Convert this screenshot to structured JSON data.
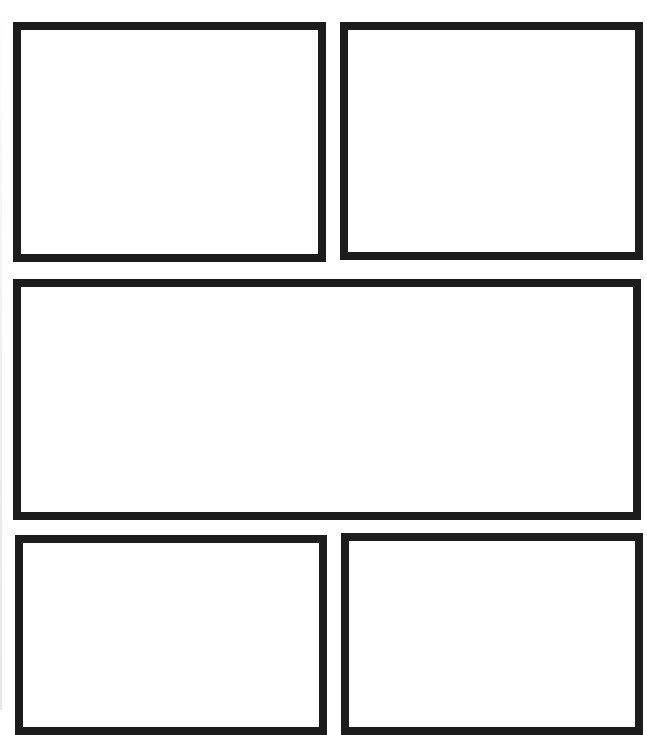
{
  "page": {
    "type": "comic-panel-layout-template",
    "background": "#ffffff",
    "border_color": "#1c1c1c",
    "border_width": 8
  },
  "panels": [
    {
      "id": "panel-1",
      "position": "top-left",
      "x": 13,
      "y": 22,
      "w": 313,
      "h": 240
    },
    {
      "id": "panel-2",
      "position": "top-right",
      "x": 340,
      "y": 22,
      "w": 303,
      "h": 238
    },
    {
      "id": "panel-3",
      "position": "middle-wide",
      "x": 13,
      "y": 279,
      "w": 628,
      "h": 241
    },
    {
      "id": "panel-4",
      "position": "bottom-left",
      "x": 15,
      "y": 535,
      "w": 312,
      "h": 200
    },
    {
      "id": "panel-5",
      "position": "bottom-right",
      "x": 341,
      "y": 533,
      "w": 302,
      "h": 202
    }
  ]
}
